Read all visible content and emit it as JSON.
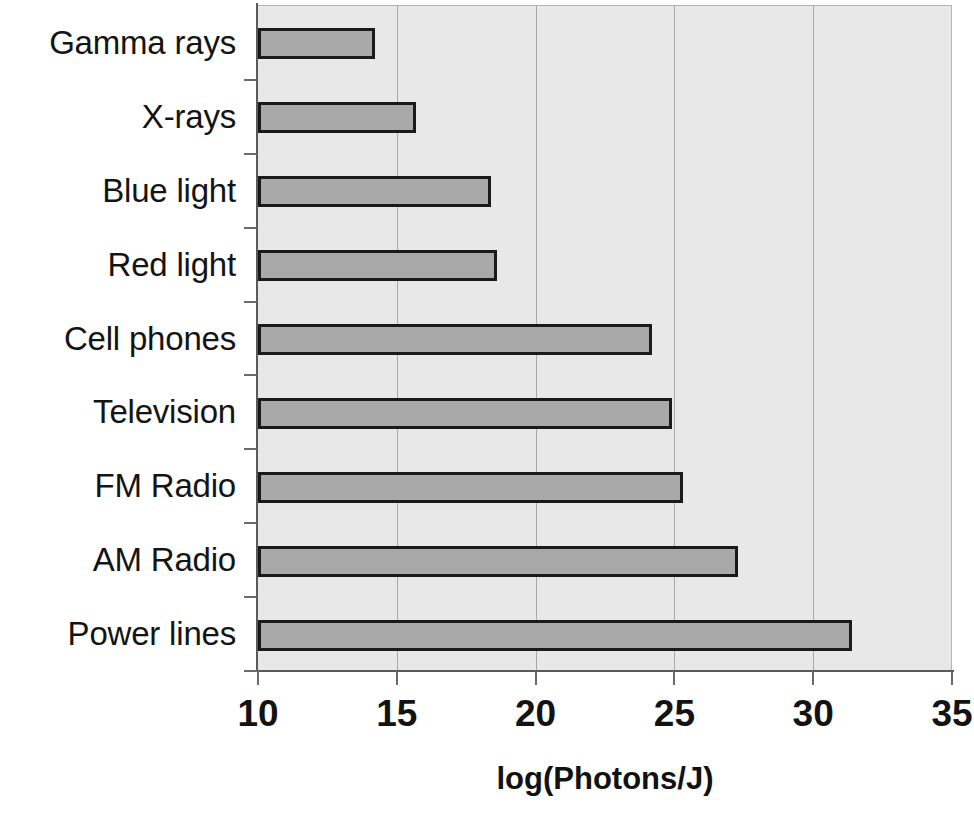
{
  "chart_data": {
    "type": "bar",
    "orientation": "horizontal",
    "title": "",
    "xlabel": "log(Photons/J)",
    "ylabel": "",
    "categories": [
      "Gamma rays",
      "X-rays",
      "Blue light",
      "Red light",
      "Cell phones",
      "Television",
      "FM Radio",
      "AM Radio",
      "Power lines"
    ],
    "values": [
      14.2,
      15.7,
      18.4,
      18.6,
      24.2,
      24.9,
      25.3,
      27.3,
      31.4
    ],
    "xlim": [
      10,
      35
    ],
    "xticks": [
      10,
      15,
      20,
      25,
      30,
      35
    ],
    "xtick_labels": [
      "10",
      "15",
      "20",
      "25",
      "30",
      "35"
    ],
    "gridlines": [
      15,
      20,
      25,
      30
    ],
    "grid": true,
    "legend": "none",
    "colors": {
      "bar_fill": "#a9a9a9",
      "bar_edge": "#1a1a1a",
      "plot_background": "#e8e8e8",
      "gridline": "#a8a8a8",
      "axis": "#5a5a5a",
      "text": "#111111"
    }
  }
}
